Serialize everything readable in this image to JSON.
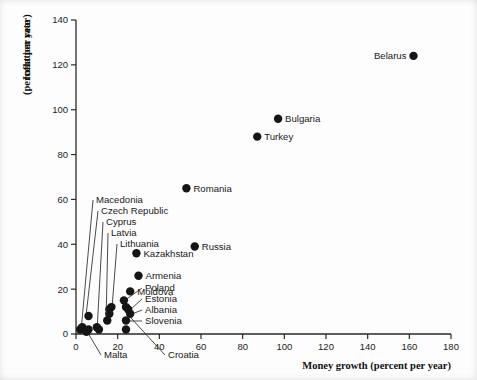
{
  "chart_data": {
    "type": "scatter",
    "title": "",
    "xlabel": "Money growth (percent per year)",
    "ylabel_line1": "Inflation rate",
    "ylabel_line2": "(percent per year)",
    "xlim": [
      0,
      180
    ],
    "ylim": [
      0,
      140
    ],
    "xticks": [
      0,
      20,
      40,
      60,
      80,
      100,
      120,
      140,
      160,
      180
    ],
    "yticks": [
      0,
      20,
      40,
      60,
      80,
      100,
      120,
      140
    ],
    "grid": false,
    "legend": "none",
    "marker_color": "#151515",
    "points": [
      {
        "label": "Belarus",
        "x": 162,
        "y": 124,
        "label_side": "left",
        "callout": false
      },
      {
        "label": "Bulgaria",
        "x": 97,
        "y": 96,
        "label_side": "right",
        "callout": false
      },
      {
        "label": "Turkey",
        "x": 87,
        "y": 88,
        "label_side": "right",
        "callout": false
      },
      {
        "label": "Romania",
        "x": 53,
        "y": 65,
        "label_side": "right",
        "callout": false
      },
      {
        "label": "Russia",
        "x": 57,
        "y": 39,
        "label_side": "right",
        "callout": false
      },
      {
        "label": "Kazakhstan",
        "x": 29,
        "y": 36,
        "label_side": "right",
        "callout": false
      },
      {
        "label": "Armenia",
        "x": 30,
        "y": 26,
        "label_side": "right",
        "callout": false
      },
      {
        "label": "Moldova",
        "x": 26,
        "y": 19,
        "label_side": "right",
        "callout": false
      },
      {
        "label": "Macedonia",
        "x": 3,
        "y": 3,
        "label_side": "callout",
        "callout": true,
        "label_px": [
          96,
          203
        ],
        "anchor_px": [
          81,
          331
        ]
      },
      {
        "label": "Czech Republic",
        "x": 6,
        "y": 8,
        "label_side": "callout",
        "callout": true,
        "label_px": [
          101,
          214
        ],
        "anchor_px": [
          86,
          316
        ]
      },
      {
        "label": "Cyprus",
        "x": 10,
        "y": 3,
        "label_side": "callout",
        "callout": true,
        "label_px": [
          106,
          225
        ],
        "anchor_px": [
          97,
          331
        ]
      },
      {
        "label": "Latvia",
        "x": 15,
        "y": 6,
        "label_side": "callout",
        "callout": true,
        "label_px": [
          111,
          236
        ],
        "anchor_px": [
          106,
          323
        ]
      },
      {
        "label": "Lithuania",
        "x": 17,
        "y": 12,
        "label_side": "callout",
        "callout": true,
        "label_px": [
          120,
          247
        ],
        "anchor_px": [
          112,
          308
        ]
      },
      {
        "label": "Poland",
        "x": 23,
        "y": 15,
        "label_side": "callout",
        "callout": true,
        "label_px": [
          145,
          291
        ],
        "anchor_px": [
          124,
          301
        ]
      },
      {
        "label": "Estonia",
        "x": 25,
        "y": 11,
        "label_side": "callout",
        "callout": true,
        "label_px": [
          145,
          302
        ],
        "anchor_px": [
          130,
          310
        ]
      },
      {
        "label": "Albania",
        "x": 26,
        "y": 9,
        "label_side": "callout",
        "callout": true,
        "label_px": [
          145,
          313
        ],
        "anchor_px": [
          132,
          314
        ]
      },
      {
        "label": "Slovenia",
        "x": 24,
        "y": 6,
        "label_side": "callout",
        "callout": true,
        "label_px": [
          145,
          324
        ],
        "anchor_px": [
          127,
          321
        ]
      },
      {
        "label": "Malta",
        "x": 5,
        "y": 1,
        "label_side": "callout-below",
        "callout": true,
        "label_px": [
          104,
          358
        ],
        "anchor_px": [
          88,
          333
        ]
      },
      {
        "label": "Croatia",
        "x": 24,
        "y": 2,
        "label_side": "callout-below",
        "callout": true,
        "label_px": [
          168,
          358
        ],
        "anchor_px": [
          131,
          318
        ]
      }
    ],
    "extra_points": [
      {
        "x": 2,
        "y": 2
      },
      {
        "x": 6,
        "y": 2
      },
      {
        "x": 11,
        "y": 2
      },
      {
        "x": 16,
        "y": 9
      },
      {
        "x": 16,
        "y": 11
      },
      {
        "x": 24,
        "y": 12
      }
    ]
  }
}
